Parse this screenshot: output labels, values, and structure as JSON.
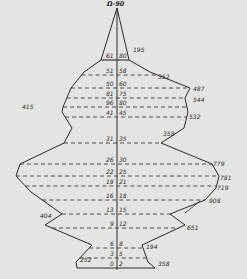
{
  "colors": {
    "background": "#e4e4e2",
    "ink": "#2a2a2a",
    "dash": "#3a3a3a"
  },
  "title": "Ω-90",
  "axis": {
    "x": 117,
    "top": 8,
    "bottom": 270
  },
  "outline": {
    "left": [
      [
        117,
        8
      ],
      [
        101,
        60
      ],
      [
        84,
        72
      ],
      [
        71,
        88
      ],
      [
        63,
        107
      ],
      [
        62,
        112
      ],
      [
        72,
        128
      ],
      [
        64,
        143
      ],
      [
        20,
        164
      ],
      [
        16,
        176
      ],
      [
        31,
        192
      ],
      [
        62,
        214
      ],
      [
        45,
        225
      ],
      [
        92,
        245
      ],
      [
        76,
        262
      ],
      [
        77,
        268
      ]
    ],
    "right": [
      [
        117,
        8
      ],
      [
        129,
        60
      ],
      [
        150,
        72
      ],
      [
        190,
        88
      ],
      [
        185,
        98
      ],
      [
        188,
        112
      ],
      [
        184,
        128
      ],
      [
        161,
        143
      ],
      [
        212,
        164
      ],
      [
        219,
        176
      ],
      [
        216,
        188
      ],
      [
        205,
        200
      ],
      [
        170,
        214
      ],
      [
        185,
        225
      ],
      [
        142,
        245
      ],
      [
        148,
        262
      ],
      [
        155,
        268
      ]
    ]
  },
  "levels": [
    {
      "y": 60,
      "left_label": "61",
      "right_label": "80",
      "dashed": false
    },
    {
      "y": 75,
      "left_label": "51",
      "right_label": "58",
      "dashed": true
    },
    {
      "y": 88,
      "left_label": "50",
      "right_label": "60",
      "dashed": true
    },
    {
      "y": 98,
      "left_label": "81",
      "right_label": "75",
      "dashed": true
    },
    {
      "y": 107,
      "left_label": "96",
      "right_label": "80",
      "dashed": true
    },
    {
      "y": 117,
      "left_label": "41",
      "right_label": "45",
      "dashed": true
    },
    {
      "y": 143,
      "left_label": "31",
      "right_label": "35",
      "dashed": true
    },
    {
      "y": 164,
      "left_label": "26",
      "right_label": "30",
      "dashed": true
    },
    {
      "y": 176,
      "left_label": "22",
      "right_label": "25",
      "dashed": true
    },
    {
      "y": 186,
      "left_label": "19",
      "right_label": "21",
      "dashed": true
    },
    {
      "y": 200,
      "left_label": "16",
      "right_label": "18",
      "dashed": true
    },
    {
      "y": 214,
      "left_label": "13",
      "right_label": "15",
      "dashed": true
    },
    {
      "y": 228,
      "left_label": "9",
      "right_label": "12",
      "dashed": true
    },
    {
      "y": 248,
      "left_label": "6",
      "right_label": "8",
      "dashed": true
    },
    {
      "y": 258,
      "left_label": "3",
      "right_label": "5",
      "dashed": true
    },
    {
      "y": 268,
      "left_label": "0",
      "right_label": "2",
      "dashed": false
    }
  ],
  "value_labels": [
    {
      "text": "195",
      "x": 133,
      "y": 47
    },
    {
      "text": "352",
      "x": 158,
      "y": 74
    },
    {
      "text": "487",
      "x": 193,
      "y": 86
    },
    {
      "text": "544",
      "x": 193,
      "y": 97
    },
    {
      "text": "415",
      "x": 22,
      "y": 104
    },
    {
      "text": "532",
      "x": 189,
      "y": 114
    },
    {
      "text": "358",
      "x": 163,
      "y": 131
    },
    {
      "text": "779",
      "x": 213,
      "y": 161
    },
    {
      "text": "781",
      "x": 220,
      "y": 175
    },
    {
      "text": "719",
      "x": 217,
      "y": 185
    },
    {
      "text": "908",
      "x": 209,
      "y": 198
    },
    {
      "text": "404",
      "x": 40,
      "y": 213
    },
    {
      "text": "651",
      "x": 187,
      "y": 225
    },
    {
      "text": "194",
      "x": 146,
      "y": 244
    },
    {
      "text": "252",
      "x": 80,
      "y": 257
    },
    {
      "text": "358",
      "x": 158,
      "y": 261
    }
  ]
}
